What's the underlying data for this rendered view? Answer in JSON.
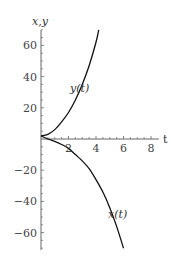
{
  "chart_data": {
    "type": "line",
    "title": "",
    "xlabel": "t",
    "ylabel": "x,y",
    "xlim": [
      0,
      8.5
    ],
    "ylim": [
      -72,
      72
    ],
    "xticks": [
      2,
      4,
      6,
      8
    ],
    "xtick_labels": [
      "2",
      "4",
      "6",
      "8"
    ],
    "yticks": [
      60,
      40,
      20,
      -20,
      -40,
      -60
    ],
    "ytick_labels": [
      "60",
      "40",
      "20",
      "−20",
      "−40",
      "−60"
    ],
    "grid": false,
    "legend": "none (curves labeled inline)",
    "series": [
      {
        "name": "y(t)",
        "label": "y(t)",
        "x": [
          0,
          0.5,
          1,
          1.5,
          2,
          2.5,
          3,
          3.5,
          4,
          4.2
        ],
        "values": [
          2,
          3,
          6,
          11,
          17,
          25,
          35,
          47,
          62,
          70
        ]
      },
      {
        "name": "x(t)",
        "label": "x(t)",
        "x": [
          0,
          0.5,
          1,
          1.5,
          2,
          2.5,
          3,
          3.5,
          4,
          4.5,
          5,
          5.5,
          6
        ],
        "values": [
          2,
          0,
          -1.5,
          -3.5,
          -6,
          -10,
          -14,
          -19,
          -26,
          -34,
          -44,
          -56,
          -70
        ]
      }
    ]
  }
}
